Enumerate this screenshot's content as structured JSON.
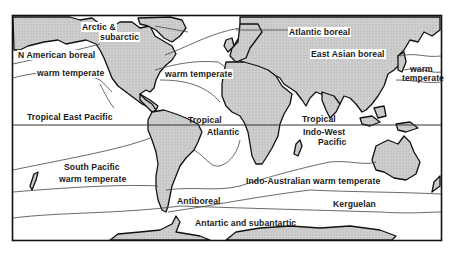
{
  "map": {
    "title": "Marine biogeographic provinces",
    "colors": {
      "land": "#c8c8c8",
      "outline": "#111111",
      "boundary": "#555555",
      "background": "#ffffff"
    },
    "regions": [
      {
        "id": "arctic",
        "label_line1": "Arctic &",
        "label_line2": "subarctic"
      },
      {
        "id": "n-american-boreal",
        "label": "N American boreal"
      },
      {
        "id": "atlantic-boreal",
        "label": "Atlantic boreal"
      },
      {
        "id": "east-asian-boreal",
        "label": "East Asian boreal"
      },
      {
        "id": "warm-temperate-ne-pacific",
        "label": "warm temperate"
      },
      {
        "id": "warm-temperate-n-atlantic",
        "label": "warm temperate"
      },
      {
        "id": "warm-temperate-nw-pacific",
        "label_line1": "warm",
        "label_line2": "temperate"
      },
      {
        "id": "tropical-east-pacific",
        "label": "Tropical East Pacific"
      },
      {
        "id": "tropical-atlantic",
        "label_line1": "Tropical",
        "label_line2": "Atlantic"
      },
      {
        "id": "tropical-indo-west-pacific",
        "label_line1": "Tropical",
        "label_line2": "Indo-West",
        "label_line3": "Pacific"
      },
      {
        "id": "south-pacific-warm-temperate",
        "label_line1": "South Pacific",
        "label_line2": "warm temperate"
      },
      {
        "id": "indo-australian-warm-temperate",
        "label": "Indo-Australian warm temperate"
      },
      {
        "id": "antiboreal",
        "label": "Antiboreal"
      },
      {
        "id": "kerguelan",
        "label": "Kerguelan"
      },
      {
        "id": "antarctic",
        "label": "Antartic and subantartic"
      }
    ]
  }
}
